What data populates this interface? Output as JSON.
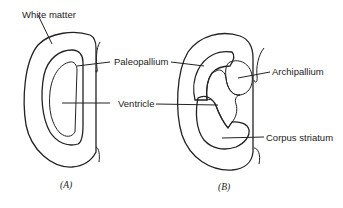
{
  "figure": {
    "panels": [
      {
        "id": "A",
        "caption": "(A)",
        "labels": {
          "white_matter": "White matter",
          "paleopallium": "Paleopallium",
          "ventricle": "Ventricle"
        }
      },
      {
        "id": "B",
        "caption": "(B)",
        "labels": {
          "archipallium": "Archipallium",
          "corpus_striatum": "Corpus striatum"
        }
      }
    ],
    "colors": {
      "line": "#222222",
      "background": "#ffffff",
      "archipallium_fill": "#e6e6e6"
    }
  }
}
